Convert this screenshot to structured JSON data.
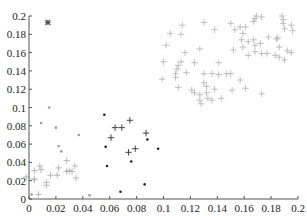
{
  "chart_data": {
    "type": "scatter",
    "title": "",
    "xlabel": "",
    "ylabel": "",
    "xlim": [
      0,
      0.2
    ],
    "ylim": [
      0,
      0.2
    ],
    "grid": false,
    "legend": null,
    "x_ticks": [
      "0",
      "0.02",
      "0.04",
      "0.06",
      "0.08",
      "0.1",
      "0.12",
      "0.14",
      "0.16",
      "0.18",
      "0.2"
    ],
    "y_ticks": [
      "0",
      "0.02",
      "0.04",
      "0.06",
      "0.08",
      "0.1",
      "0.12",
      "0.14",
      "0.16",
      "0.18",
      "0.2"
    ],
    "series": [
      {
        "name": "cluster-gray-plus",
        "marker": "plus",
        "color": "#b8b8b8",
        "points": [
          [
            0.114,
            0.19
          ],
          [
            0.13,
            0.193
          ],
          [
            0.105,
            0.181
          ],
          [
            0.113,
            0.18
          ],
          [
            0.138,
            0.185
          ],
          [
            0.102,
            0.168
          ],
          [
            0.116,
            0.16
          ],
          [
            0.127,
            0.164
          ],
          [
            0.1,
            0.15
          ],
          [
            0.113,
            0.15
          ],
          [
            0.111,
            0.146
          ],
          [
            0.11,
            0.142
          ],
          [
            0.109,
            0.137
          ],
          [
            0.109,
            0.133
          ],
          [
            0.099,
            0.131
          ],
          [
            0.123,
            0.149
          ],
          [
            0.117,
            0.138
          ],
          [
            0.13,
            0.137
          ],
          [
            0.136,
            0.137
          ],
          [
            0.141,
            0.149
          ],
          [
            0.141,
            0.136
          ],
          [
            0.147,
            0.137
          ],
          [
            0.15,
            0.137
          ],
          [
            0.157,
            0.13
          ],
          [
            0.13,
            0.127
          ],
          [
            0.132,
            0.123
          ],
          [
            0.138,
            0.12
          ],
          [
            0.151,
            0.119
          ],
          [
            0.161,
            0.121
          ],
          [
            0.111,
            0.122
          ],
          [
            0.121,
            0.119
          ],
          [
            0.123,
            0.116
          ],
          [
            0.127,
            0.114
          ],
          [
            0.132,
            0.116
          ],
          [
            0.133,
            0.11
          ],
          [
            0.127,
            0.108
          ],
          [
            0.128,
            0.104
          ],
          [
            0.136,
            0.108
          ],
          [
            0.143,
            0.11
          ],
          [
            0.173,
            0.115
          ],
          [
            0.15,
            0.192
          ],
          [
            0.153,
            0.185
          ],
          [
            0.157,
            0.188
          ],
          [
            0.161,
            0.188
          ],
          [
            0.159,
            0.181
          ],
          [
            0.152,
            0.163
          ],
          [
            0.158,
            0.174
          ],
          [
            0.163,
            0.172
          ],
          [
            0.167,
            0.174
          ],
          [
            0.168,
            0.168
          ],
          [
            0.172,
            0.17
          ],
          [
            0.159,
            0.166
          ],
          [
            0.163,
            0.157
          ],
          [
            0.168,
            0.161
          ],
          [
            0.173,
            0.159
          ],
          [
            0.177,
            0.159
          ],
          [
            0.178,
            0.177
          ],
          [
            0.168,
            0.197
          ],
          [
            0.169,
            0.2
          ],
          [
            0.173,
            0.199
          ],
          [
            0.167,
            0.194
          ],
          [
            0.188,
            0.2
          ],
          [
            0.189,
            0.196
          ],
          [
            0.189,
            0.192
          ],
          [
            0.195,
            0.19
          ],
          [
            0.196,
            0.184
          ],
          [
            0.19,
            0.186
          ],
          [
            0.185,
            0.176
          ],
          [
            0.186,
            0.166
          ],
          [
            0.184,
            0.175
          ],
          [
            0.192,
            0.162
          ],
          [
            0.195,
            0.16
          ],
          [
            0.183,
            0.157
          ],
          [
            0.186,
            0.155
          ],
          [
            0.19,
            0.152
          ]
        ]
      },
      {
        "name": "cluster-gray-lowleft-plus",
        "marker": "plus",
        "color": "#b0b0b0",
        "points": [
          [
            0.008,
            0.036
          ],
          [
            0.028,
            0.042
          ],
          [
            0.022,
            0.034
          ],
          [
            0.03,
            0.031
          ],
          [
            0.028,
            0.03
          ],
          [
            0.034,
            0.036
          ],
          [
            0.009,
            0.032
          ],
          [
            0.004,
            0.031
          ],
          [
            0.016,
            0.026
          ],
          [
            0.021,
            0.026
          ],
          [
            0.035,
            0.023
          ],
          [
            0.004,
            0.022
          ],
          [
            0.013,
            0.018
          ],
          [
            0.013,
            0.015
          ],
          [
            0.004,
            0.021
          ],
          [
            0.007,
            0.005
          ],
          [
            0.032,
            0.03
          ],
          [
            -0.002,
            0.024
          ]
        ]
      },
      {
        "name": "cluster-gray-lowleft-dot",
        "marker": "dot",
        "color": "#9a9a9a",
        "points": [
          [
            0.015,
            0.1
          ],
          [
            0.009,
            0.083
          ],
          [
            0.02,
            0.078
          ],
          [
            0.037,
            0.07
          ],
          [
            0.022,
            0.058
          ],
          [
            0.024,
            0.052
          ],
          [
            0.045,
            0.004
          ],
          [
            0.002,
            0.005
          ]
        ]
      },
      {
        "name": "cluster-dark-plus",
        "marker": "plus",
        "color": "#333333",
        "points": [
          [
            0.075,
            0.086
          ],
          [
            0.064,
            0.078
          ],
          [
            0.069,
            0.078
          ],
          [
            0.087,
            0.072
          ],
          [
            0.061,
            0.067
          ],
          [
            0.079,
            0.055
          ],
          [
            0.074,
            0.051
          ]
        ]
      },
      {
        "name": "cluster-dark-dot",
        "marker": "dot",
        "color": "#222222",
        "points": [
          [
            0.056,
            0.092
          ],
          [
            0.088,
            0.065
          ],
          [
            0.057,
            0.057
          ],
          [
            0.096,
            0.055
          ],
          [
            0.058,
            0.036
          ],
          [
            0.076,
            0.041
          ],
          [
            0.086,
            0.016
          ],
          [
            0.068,
            0.008
          ]
        ]
      },
      {
        "name": "outlier-star",
        "marker": "star",
        "color": "#555555",
        "points": [
          [
            0.014,
            0.193
          ]
        ]
      }
    ]
  }
}
